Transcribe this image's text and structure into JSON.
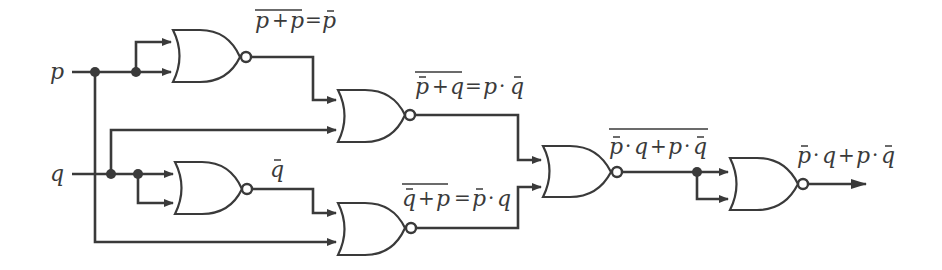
{
  "diagram": {
    "type": "logic-circuit",
    "colors": {
      "ink": "#3a3a3a",
      "background": "#ffffff"
    },
    "inputs": [
      {
        "id": "p",
        "label": "p"
      },
      {
        "id": "q",
        "label": "q"
      }
    ],
    "gates": [
      {
        "id": "g1",
        "type": "NOR",
        "inputs": [
          "p",
          "p"
        ],
        "output_label": {
          "over": "p + p",
          "eq": "=",
          "rhs": "p̄"
        }
      },
      {
        "id": "g2",
        "type": "NOR",
        "inputs": [
          "g1",
          "q"
        ],
        "output_label": {
          "over": "p̄ + q",
          "eq": "=",
          "rhs": "p · q̄"
        }
      },
      {
        "id": "g3",
        "type": "NOR",
        "inputs": [
          "q",
          "q"
        ],
        "output_label": {
          "rhs": "q̄"
        }
      },
      {
        "id": "g4",
        "type": "NOR",
        "inputs": [
          "g3",
          "p"
        ],
        "output_label": {
          "over": "q̄ + p",
          "eq": "=",
          "rhs": "p̄ · q"
        }
      },
      {
        "id": "g5",
        "type": "NOR",
        "inputs": [
          "g2",
          "g4"
        ],
        "output_label": {
          "over": "p̄ · q + p · q̄"
        }
      },
      {
        "id": "g6",
        "type": "NOR",
        "inputs": [
          "g5",
          "g5"
        ],
        "output_label": {
          "rhs": "p̄ · q + p · q̄"
        }
      }
    ],
    "labels": {
      "p_input": "p",
      "q_input": "q",
      "g1_out": "p+p=p̄",
      "g2_out": "p̄+q=p·q̄",
      "g3_out": "q̄",
      "g4_out": "q̄+p=p̄·q",
      "g5_out": "p̄·q+p·q̄",
      "g6_out": "p̄·q+p·q̄"
    },
    "text": {
      "p": "p",
      "q": "q",
      "plus": "+",
      "eq": "=",
      "dot": "·"
    }
  }
}
